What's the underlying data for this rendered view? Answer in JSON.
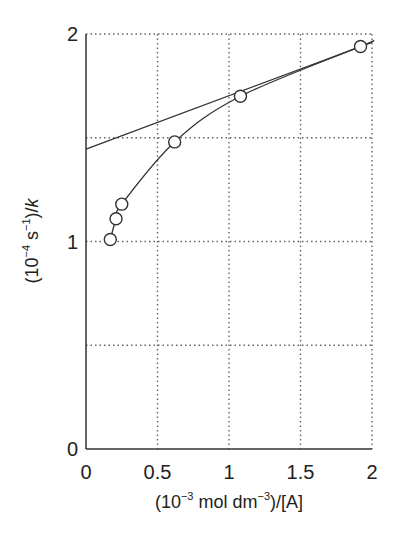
{
  "chart_data": {
    "type": "scatter",
    "title": "",
    "xlabel": "(10^-3 mol dm^-3)/[A]",
    "ylabel": "(10^-4 s^-1)/k",
    "xlabel_parts": {
      "pre": "(10",
      "sup": "−3",
      "post": " mol dm",
      "sup2": "−3",
      "end": ")/[A]"
    },
    "ylabel_parts": {
      "pre": "(10",
      "sup": "−4",
      "mid": " s",
      "sup2": "−1",
      "end": ")/",
      "italic": "k"
    },
    "xlim": [
      0,
      2
    ],
    "ylim": [
      0,
      2
    ],
    "x_ticks": [
      0,
      0.5,
      1,
      1.5,
      2
    ],
    "x_tick_labels": [
      "0",
      "0.5",
      "1",
      "1.5",
      "2"
    ],
    "y_ticks": [
      0,
      1,
      2
    ],
    "y_tick_labels": [
      "0",
      "1",
      "2"
    ],
    "grid": {
      "on": true,
      "style": "dotted",
      "x": [
        0.5,
        1,
        1.5,
        2
      ],
      "y": [
        0.5,
        1,
        1.5,
        2
      ]
    },
    "legend": null,
    "series": [
      {
        "name": "data",
        "marker": "open-circle",
        "connected": "smooth-curve",
        "x": [
          0.17,
          0.21,
          0.25,
          0.62,
          1.08,
          1.92
        ],
        "y": [
          1.01,
          1.11,
          1.18,
          1.48,
          1.7,
          1.94
        ]
      },
      {
        "name": "linear fit",
        "marker": "none",
        "line": "solid",
        "x": [
          0,
          2
        ],
        "y": [
          1.445,
          1.96
        ]
      }
    ]
  }
}
